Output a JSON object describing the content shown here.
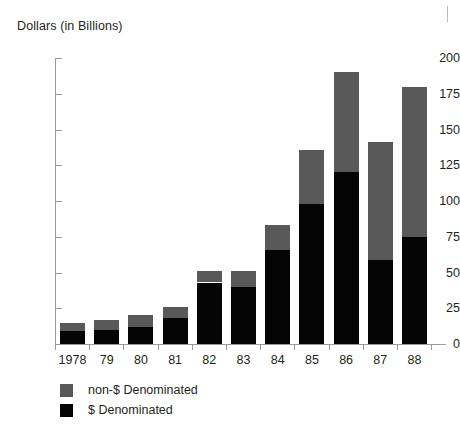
{
  "chart_data": {
    "type": "bar",
    "title": "Dollars (in Billions)",
    "subtitle": "",
    "xlabel": "",
    "ylabel": "Dollars (in Billions)",
    "stacked": true,
    "grid": false,
    "legend_position": "bottom-left",
    "ylim": [
      0,
      200
    ],
    "ytick_labels": [
      "0",
      "25",
      "50",
      "75",
      "100",
      "125",
      "150",
      "175",
      "200"
    ],
    "ytick_values": [
      0,
      25,
      50,
      75,
      100,
      125,
      150,
      175,
      200
    ],
    "categories": [
      "1978",
      "79",
      "80",
      "81",
      "82",
      "83",
      "84",
      "85",
      "86",
      "87",
      "88"
    ],
    "series": [
      {
        "name": "$ Denominated",
        "color": "#050505",
        "values": [
          9,
          10,
          12,
          18,
          43,
          40,
          66,
          98,
          120,
          59,
          75
        ]
      },
      {
        "name": "non-$ Denominated",
        "color": "#595959",
        "values": [
          6,
          7,
          8,
          8,
          8,
          11,
          17,
          38,
          70,
          82,
          105
        ]
      }
    ],
    "totals": [
      15,
      17,
      20,
      26,
      51,
      51,
      83,
      136,
      190,
      141,
      180
    ]
  },
  "legend": {
    "items": [
      {
        "label": "non-$ Denominated",
        "color": "#595959"
      },
      {
        "label": "$ Denominated",
        "color": "#050505"
      }
    ]
  }
}
